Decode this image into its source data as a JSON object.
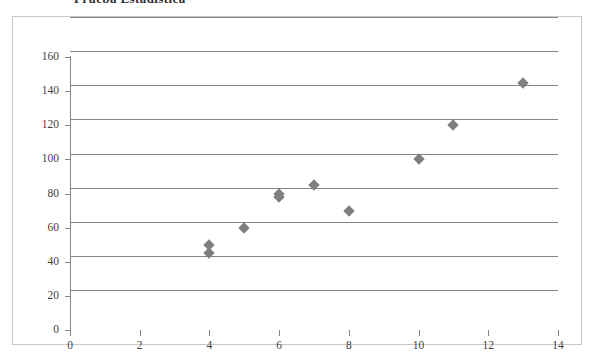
{
  "page": {
    "heading": "Prueba  Estadistica"
  },
  "chart_data": {
    "type": "scatter",
    "title": "",
    "xlabel": "",
    "ylabel": "",
    "xlim": [
      0,
      14
    ],
    "ylim": [
      0,
      160
    ],
    "x_ticks": [
      0,
      2,
      4,
      6,
      8,
      10,
      12,
      14
    ],
    "y_ticks": [
      0,
      20,
      40,
      60,
      80,
      100,
      120,
      140,
      160
    ],
    "grid": "horizontal",
    "legend": "none",
    "marker": {
      "shape": "diamond",
      "color": "#7f7f7f",
      "size": 8
    },
    "series": [
      {
        "name": "Series 1",
        "points": [
          {
            "x": 4,
            "y": 45
          },
          {
            "x": 4,
            "y": 50
          },
          {
            "x": 5,
            "y": 60
          },
          {
            "x": 6,
            "y": 78
          },
          {
            "x": 6,
            "y": 80
          },
          {
            "x": 7,
            "y": 85
          },
          {
            "x": 8,
            "y": 70
          },
          {
            "x": 10,
            "y": 100
          },
          {
            "x": 11,
            "y": 120
          },
          {
            "x": 13,
            "y": 145
          }
        ]
      }
    ]
  },
  "colors": {
    "marker": "#7f7f7f",
    "gridline": "#868686",
    "axis": "#868686",
    "frame_border": "#c8c8c8",
    "text": "#3f3f3f"
  }
}
